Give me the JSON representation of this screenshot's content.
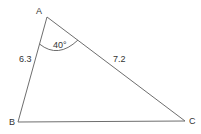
{
  "diagram": {
    "type": "triangle",
    "vertices": [
      {
        "label": "A",
        "x": 47,
        "y": 17,
        "label_x": 36,
        "label_y": 14
      },
      {
        "label": "B",
        "x": 18,
        "y": 122,
        "label_x": 9,
        "label_y": 125
      },
      {
        "label": "C",
        "x": 185,
        "y": 121,
        "label_x": 189,
        "label_y": 124
      }
    ],
    "sides": [
      {
        "name": "AB",
        "label": "6.3",
        "label_x": 19,
        "label_y": 62
      },
      {
        "name": "AC",
        "label": "7.2",
        "label_x": 113,
        "label_y": 62
      },
      {
        "name": "BC",
        "label": ""
      }
    ],
    "angle": {
      "vertex": "A",
      "label": "40°",
      "label_x": 53,
      "label_y": 48
    },
    "colors": {
      "line": "#6e6e6e",
      "text": "#333333",
      "background": "#ffffff"
    }
  }
}
